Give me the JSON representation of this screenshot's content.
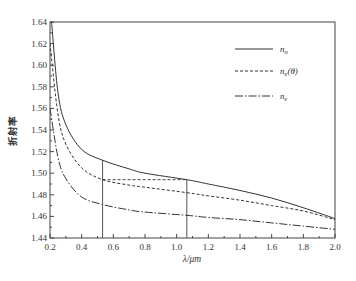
{
  "chart_data": {
    "type": "line",
    "title": "",
    "xlabel": "λ/μm",
    "ylabel": "折射率",
    "xlim": [
      0.2,
      2.0
    ],
    "ylim": [
      1.44,
      1.64
    ],
    "xticks": [
      0.2,
      0.4,
      0.6,
      0.8,
      1.0,
      1.2,
      1.4,
      1.6,
      1.8,
      2.0
    ],
    "xtick_labels": [
      "0.2",
      "0.4",
      "0.6",
      "0.8",
      "1.0",
      "1.2",
      "1.4",
      "1.6",
      "1.8",
      "2.0"
    ],
    "yticks": [
      1.44,
      1.46,
      1.48,
      1.5,
      1.52,
      1.54,
      1.56,
      1.58,
      1.6,
      1.62,
      1.64
    ],
    "ytick_labels": [
      "1.44",
      "1.46",
      "1.48",
      "1.50",
      "1.52",
      "1.54",
      "1.56",
      "1.58",
      "1.60",
      "1.62",
      "1.64"
    ],
    "grid": false,
    "legend_position": "top-right",
    "series": [
      {
        "name": "n_o",
        "label_main": "n",
        "label_sub": "o",
        "label_suffix": "",
        "style": "solid",
        "x": [
          0.21,
          0.25,
          0.3,
          0.4,
          0.532,
          0.7,
          0.8,
          1.064,
          1.2,
          1.4,
          1.6,
          1.8,
          2.0
        ],
        "y": [
          1.64,
          1.575,
          1.545,
          1.522,
          1.512,
          1.504,
          1.5,
          1.494,
          1.49,
          1.484,
          1.477,
          1.468,
          1.458
        ]
      },
      {
        "name": "n_e(θ)",
        "label_main": "n",
        "label_sub": "e",
        "label_suffix": "(θ)",
        "style": "dashed",
        "x": [
          0.2,
          0.25,
          0.3,
          0.4,
          0.532,
          0.7,
          0.8,
          1.064,
          1.2,
          1.4,
          1.6,
          1.8,
          2.0
        ],
        "y": [
          1.62,
          1.555,
          1.527,
          1.505,
          1.494,
          1.489,
          1.487,
          1.482,
          1.479,
          1.475,
          1.47,
          1.465,
          1.457
        ]
      },
      {
        "name": "n_e",
        "label_main": "n",
        "label_sub": "e",
        "label_suffix": "",
        "style": "dashdot",
        "x": [
          0.2,
          0.25,
          0.3,
          0.4,
          0.532,
          0.7,
          0.8,
          1.064,
          1.2,
          1.4,
          1.6,
          1.8,
          2.0
        ],
        "y": [
          1.56,
          1.515,
          1.495,
          1.478,
          1.471,
          1.466,
          1.464,
          1.461,
          1.459,
          1.457,
          1.454,
          1.451,
          1.448
        ]
      }
    ],
    "annotations": {
      "vertical_lines": [
        {
          "x": 0.532,
          "y_from": 1.44,
          "y_to": 1.512
        },
        {
          "x": 1.064,
          "y_from": 1.44,
          "y_to": 1.494
        }
      ],
      "phase_match_line": {
        "x_from": 0.532,
        "x_to": 1.064,
        "y": 1.494,
        "style": "dashed"
      }
    }
  }
}
